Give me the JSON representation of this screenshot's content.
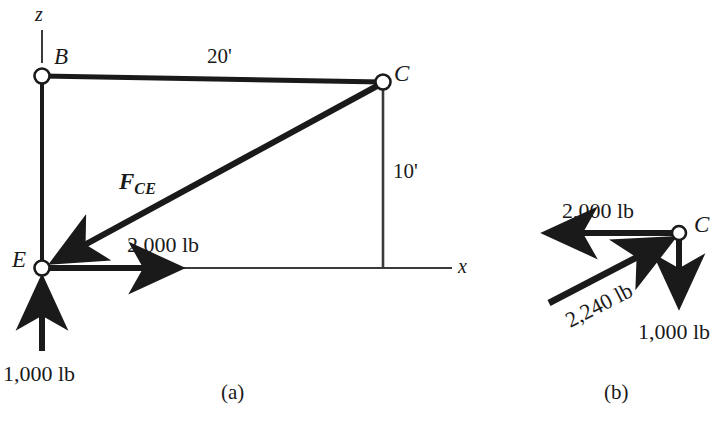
{
  "figure": {
    "panels": [
      {
        "caption": "(a)",
        "name": "space-diagram",
        "axes": [
          {
            "label": "z",
            "direction": "up"
          },
          {
            "label": "x",
            "direction": "right"
          }
        ],
        "joints": [
          {
            "label": "B"
          },
          {
            "label": "C"
          },
          {
            "label": "E"
          }
        ],
        "dimensions": [
          {
            "label": "20'",
            "member": "B-C"
          },
          {
            "label": "10'",
            "member": "C-bottom"
          }
        ],
        "forces": [
          {
            "label": "F",
            "subscript": "CE",
            "member": "C-E",
            "kind": "member-force"
          },
          {
            "label": "2,000 lb",
            "direction": "right",
            "at": "E"
          },
          {
            "label": "1,000 lb",
            "direction": "up",
            "at": "E"
          }
        ]
      },
      {
        "caption": "(b)",
        "name": "free-body-diagram",
        "joints": [
          {
            "label": "C"
          }
        ],
        "forces": [
          {
            "label": "2,000 lb",
            "direction": "left",
            "at": "C"
          },
          {
            "label": "2,240 lb",
            "direction": "up-right",
            "at": "C"
          },
          {
            "label": "1,000 lb",
            "direction": "down",
            "at": "C"
          }
        ]
      }
    ],
    "colors": {
      "ink": "#1a1a1a",
      "thin_line": "#3a3a3a",
      "background": "#ffffff"
    }
  }
}
